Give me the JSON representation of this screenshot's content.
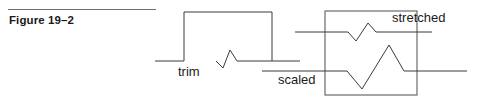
{
  "figure": {
    "caption": "Figure 19–2",
    "rule_color": "#6e6e6e",
    "caption_color": "#1a1a1a"
  },
  "diagram": {
    "stroke_color": "#3a3a3a",
    "box_stroke_color": "#6b6b6b",
    "background": "#ffffff",
    "labels": {
      "trim": "trim",
      "scaled": "scaled",
      "stretched": "stretched"
    },
    "shapes": {
      "trim_box": {
        "x": 184,
        "y": 12,
        "width": 88,
        "height": 49
      },
      "trim_baseline": {
        "x1": 155,
        "y1": 61,
        "x2": 300,
        "y2": 61
      },
      "trim_pulse_points": "155,61 184,61 184,12 272,12 272,61 300,61",
      "trim_zigzag_points": "216,61 223,68 230,50 237,61 272,61",
      "scale_box": {
        "x": 325,
        "y": 11,
        "width": 92,
        "height": 84
      },
      "stretched_baseline": {
        "x1": 295,
        "y1": 32,
        "x2": 432,
        "y2": 32
      },
      "stretched_wave_points": "295,32 348,32 356,41 368,23 376,32 432,32",
      "scaled_baseline": {
        "x1": 262,
        "y1": 71,
        "x2": 467,
        "y2": 71
      },
      "scaled_wave_points": "262,71 347,71 362,89 389,45 404,71 467,71"
    }
  }
}
